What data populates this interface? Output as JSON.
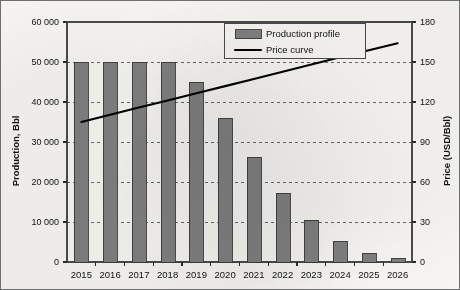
{
  "chart_data": {
    "type": "bar",
    "title": "",
    "subtitle": "",
    "categories": [
      "2015",
      "2016",
      "2017",
      "2018",
      "2019",
      "2020",
      "2021",
      "2022",
      "2023",
      "2024",
      "2025",
      "2026"
    ],
    "xlabel": "",
    "ylabel": "Production, Bbl",
    "y2label": "Price (USD/Bbl)",
    "ylim": [
      0,
      60000
    ],
    "y2lim": [
      0,
      180
    ],
    "ytick_labels": [
      "0",
      "10 000",
      "20 000",
      "30 000",
      "40 000",
      "50 000",
      "60 000"
    ],
    "ytick_values": [
      0,
      10000,
      20000,
      30000,
      40000,
      50000,
      60000
    ],
    "y2tick_labels": [
      "0",
      "30",
      "60",
      "90",
      "120",
      "150",
      "180"
    ],
    "y2tick_values": [
      0,
      30,
      60,
      90,
      120,
      150,
      180
    ],
    "grid": "horizontal-dashed",
    "legend_position": "top-center-right",
    "series": [
      {
        "name": "Production profile",
        "kind": "bar",
        "axis": "left",
        "color": "#808080",
        "edge_color": "#3a3a3a",
        "values": [
          50000,
          50000,
          50000,
          50000,
          45000,
          36000,
          26300,
          17300,
          10400,
          5200,
          2300,
          1100
        ]
      },
      {
        "name": "Price curve",
        "kind": "line",
        "axis": "right",
        "color": "#000000",
        "values": [
          105,
          110.4,
          115.8,
          121.2,
          126.5,
          131.9,
          137.3,
          142.7,
          148.1,
          153.5,
          158.8,
          164
        ]
      }
    ],
    "legend_entries": [
      {
        "label": "Production profile",
        "marker": "swatch",
        "color": "#808080"
      },
      {
        "label": "Price curve",
        "marker": "line",
        "color": "#000000"
      }
    ]
  }
}
